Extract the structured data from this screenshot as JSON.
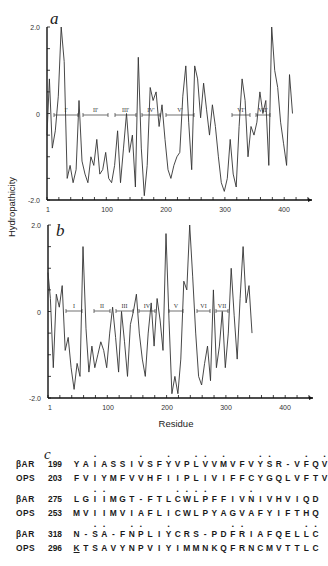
{
  "chart_data": [
    {
      "type": "line",
      "panel": "a",
      "title": "",
      "xlabel": "Residue",
      "ylabel": "Hydropathicity",
      "xlim": [
        1,
        450
      ],
      "ylim": [
        -2.0,
        2.0
      ],
      "x_ticks": [
        "1",
        "100",
        "200",
        "300",
        "400"
      ],
      "y_ticks": [
        "2.0",
        "0",
        "-2.0"
      ],
      "segments": [
        "I'",
        "II'",
        "III'",
        "IV'",
        "V'",
        "VI'",
        "VII'"
      ],
      "series": [
        {
          "name": "hydropathy profile a",
          "x": [
            1,
            5,
            10,
            15,
            20,
            25,
            30,
            35,
            40,
            45,
            50,
            55,
            60,
            65,
            70,
            75,
            80,
            85,
            90,
            95,
            100,
            105,
            110,
            115,
            120,
            125,
            130,
            135,
            140,
            145,
            150,
            155,
            160,
            165,
            170,
            175,
            180,
            185,
            190,
            195,
            200,
            205,
            210,
            215,
            220,
            225,
            230,
            235,
            240,
            245,
            250,
            255,
            260,
            265,
            270,
            275,
            280,
            285,
            290,
            295,
            300,
            305,
            310,
            315,
            320,
            325,
            330,
            335,
            340,
            345,
            350,
            355,
            360,
            365,
            370,
            375,
            380,
            385,
            390,
            395,
            400,
            405,
            410,
            415
          ],
          "values": [
            -0.5,
            0.8,
            -0.8,
            -0.4,
            0.4,
            2.0,
            1.2,
            -1.5,
            -1.2,
            -1.6,
            -1.3,
            0.3,
            -1.1,
            -1.4,
            -1.6,
            -1.0,
            -1.2,
            -0.6,
            -1.4,
            -1.3,
            -0.9,
            -1.5,
            -1.6,
            -1.2,
            -0.4,
            -1.6,
            -0.8,
            0.0,
            -0.9,
            -0.5,
            -1.7,
            1.3,
            -0.8,
            -1.9,
            -1.2,
            0.6,
            0.3,
            0.5,
            -0.3,
            0.2,
            -0.6,
            -1.3,
            -1.5,
            -1.2,
            -1.0,
            -0.9,
            0.4,
            1.1,
            -0.2,
            -1.3,
            1.1,
            0.8,
            -0.1,
            0.7,
            0.1,
            -0.5,
            0.2,
            -0.3,
            -1.0,
            -1.6,
            -1.8,
            -1.5,
            -0.6,
            -1.4,
            -1.7,
            -0.3,
            0.8,
            0.3,
            -1.0,
            -0.3,
            -0.5,
            -0.2,
            0.5,
            0.0,
            0.3,
            -1.2,
            2.0,
            1.0,
            0.6,
            -0.2,
            -0.7,
            -1.2,
            0.9,
            0.0
          ]
        }
      ]
    },
    {
      "type": "line",
      "panel": "b",
      "title": "",
      "xlabel": "Residue",
      "ylabel": "Hydropathicity",
      "xlim": [
        1,
        450
      ],
      "ylim": [
        -2.0,
        2.0
      ],
      "x_ticks": [
        "1",
        "100",
        "200",
        "300",
        "400"
      ],
      "y_ticks": [
        "2.0",
        "0",
        "-2.0"
      ],
      "segments": [
        "I",
        "II",
        "III",
        "IV",
        "V",
        "VI",
        "VII"
      ],
      "series": [
        {
          "name": "hydropathy profile b",
          "x": [
            1,
            5,
            10,
            15,
            20,
            25,
            30,
            35,
            40,
            45,
            50,
            55,
            60,
            65,
            70,
            75,
            80,
            85,
            90,
            95,
            100,
            105,
            110,
            115,
            120,
            125,
            130,
            135,
            140,
            145,
            150,
            155,
            160,
            165,
            170,
            175,
            180,
            185,
            190,
            195,
            200,
            205,
            210,
            215,
            220,
            225,
            230,
            235,
            240,
            245,
            250,
            255,
            260,
            265,
            270,
            275,
            280,
            285,
            290,
            295,
            300,
            305,
            310,
            315,
            320,
            325,
            330,
            335,
            340,
            345
          ],
          "values": [
            0.9,
            0.3,
            -1.3,
            0.4,
            0.1,
            0.6,
            -0.9,
            -0.6,
            -1.3,
            -1.8,
            -1.2,
            -1.5,
            1.5,
            -0.4,
            -1.4,
            -0.8,
            -1.3,
            -1.0,
            -0.7,
            -0.9,
            -1.3,
            -0.5,
            0.1,
            -0.6,
            -1.4,
            0.0,
            -0.7,
            -1.5,
            -0.3,
            0.0,
            0.4,
            -0.5,
            -1.1,
            -1.5,
            -0.5,
            0.2,
            -0.8,
            0.3,
            -0.2,
            -0.9,
            1.8,
            -0.2,
            -1.9,
            -1.5,
            -1.9,
            -1.1,
            0.7,
            0.5,
            2.0,
            0.8,
            -0.5,
            -1.5,
            -1.7,
            -1.2,
            -0.8,
            -1.6,
            0.5,
            -1.3,
            -0.8,
            0.0,
            -1.3,
            -0.5,
            1.0,
            -0.1,
            -1.1,
            0.3,
            1.5,
            0.2,
            0.6,
            -0.5
          ]
        }
      ]
    }
  ],
  "panels": {
    "a": {
      "letter": "a"
    },
    "b": {
      "letter": "b"
    },
    "c": {
      "letter": "c"
    }
  },
  "axes": {
    "ylabel": "Hydropathicity",
    "xlabel": "Residue",
    "y_ticks": [
      "2.0",
      "0",
      "-2.0"
    ],
    "x_ticks": [
      "1",
      "100",
      "200",
      "300",
      "400"
    ]
  },
  "alignment": {
    "groups": [
      {
        "rows": [
          {
            "name": "βAR",
            "start": "199",
            "residues": "YAIASSIVSFYVPLVVMVFVYSR-VFQV",
            "marked": [
              2,
              7,
              10,
              13,
              14,
              16,
              20,
              21,
              25,
              27
            ]
          },
          {
            "name": "OPS",
            "start": "203",
            "residues": "FVIYMFVVHFIIPLIVIFFCYGQLVFTV",
            "marked": []
          }
        ]
      },
      {
        "rows": [
          {
            "name": "βAR",
            "start": "275",
            "residues": "LGIIMGT-FTLCWLPFFIVNIVHVIQD",
            "marked": [
              2,
              3,
              11,
              12,
              13,
              14,
              19
            ]
          },
          {
            "name": "OPS",
            "start": "253",
            "residues": "MVIIMVIAFLICWLPYAGVAFYIFTHQ",
            "marked": []
          }
        ]
      },
      {
        "rows": [
          {
            "name": "βAR",
            "start": "318",
            "residues": "N-SA-FNPLIYCRS-PDFRIAFQELLC",
            "marked": [
              2,
              3,
              6,
              7,
              10,
              17,
              18,
              25,
              26
            ]
          },
          {
            "name": "OPS",
            "start": "296",
            "residues": "KTSAVYNPVIYIMMNKQFRNCMVTTLC",
            "marked": [],
            "underlined": [
              0
            ]
          }
        ]
      }
    ]
  },
  "caption_fragment": "Fig. 1  Comparison of ... hydropathy plots ... for β-adrenergic receptor (βAR) and"
}
